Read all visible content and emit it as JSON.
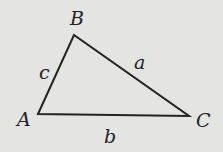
{
  "diagram": {
    "type": "triangle",
    "background": "#e4e4e2",
    "stroke_color": "#222222",
    "vertices": [
      {
        "label": "A",
        "x": 38,
        "y": 114
      },
      {
        "label": "B",
        "x": 74,
        "y": 35
      },
      {
        "label": "C",
        "x": 189,
        "y": 116
      }
    ],
    "sides": [
      {
        "label": "a",
        "between": "B-C"
      },
      {
        "label": "b",
        "between": "A-C"
      },
      {
        "label": "c",
        "between": "A-B"
      }
    ]
  }
}
